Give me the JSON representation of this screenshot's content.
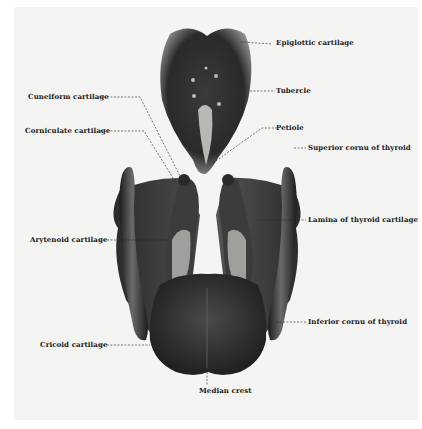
{
  "figure": {
    "labels": {
      "epiglottic_cartilage": "Epiglottic cartilage",
      "tubercle": "Tubercle",
      "cuneiform_cartilage": "Cuneiform cartilage",
      "corniculate_cartilage": "Corniculate cartilage",
      "petiole": "Petiole",
      "superior_cornu_of_thyroid": "Superior cornu of thyroid",
      "lamina_of_thyroid_cartilage": "Lamina of thyroid cartilage",
      "arytenoid_cartilage": "Arytenoid cartilage",
      "inferior_cornu_of_thyroid": "Inferior cornu of thyroid",
      "cricoid_cartilage": "Cricoid cartilage",
      "median_crest": "Median crest"
    }
  },
  "colors": {
    "panel": "#f4f4f2",
    "cartilage_dark": "#2a2a2a",
    "cartilage_mid": "#5a5a5a",
    "highlight": "#d8d8d4",
    "leader_line": "#222222"
  }
}
